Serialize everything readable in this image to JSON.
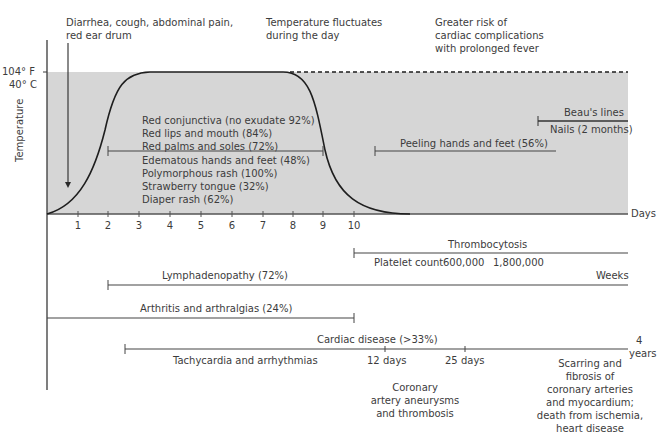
{
  "annotations_top": {
    "early_symptoms": [
      "Diarrhea, cough, abdominal pain,",
      "red ear drum"
    ],
    "temperature_note": [
      "Temperature fluctuates",
      "during the day"
    ],
    "risk_note": [
      "Greater risk of",
      "cardiac complications",
      "with prolonged fever"
    ]
  },
  "axis": {
    "y_label": "Temperature",
    "y_tick_f": "104° F",
    "y_tick_c": "40° C",
    "x_label_days": "Days",
    "x_ticks": [
      "1",
      "2",
      "3",
      "4",
      "5",
      "6",
      "7",
      "8",
      "9",
      "10"
    ]
  },
  "acute_symptoms": [
    "Red conjunctiva (no exudate 92%)",
    "Red lips and mouth (84%)",
    "Red palms and soles (72%)",
    "Edematous hands and feet (48%)",
    "Polymorphous rash (100%)",
    "Strawberry tongue (32%)",
    "Diaper rash (62%)"
  ],
  "subacute": {
    "peeling": "Peeling hands and feet (56%)",
    "beaus_lines": "Beau's lines",
    "nails": "Nails (2 months)"
  },
  "timelines": {
    "thrombocytosis": "Thrombocytosis",
    "platelet_label": "Platelet count",
    "platelet_low": "600,000",
    "platelet_high": "1,800,000",
    "weeks": "Weeks",
    "lymphadenopathy": "Lymphadenopathy (72%)",
    "arthritis": "Arthritis and arthralgias (24%)",
    "cardiac": "Cardiac disease (>33%)",
    "tachy": "Tachycardia and arrhythmias",
    "day12": "12 days",
    "day25": "25 days",
    "years_num": "4",
    "years_label": "years"
  },
  "cardiac_outcomes": {
    "aneurysm": [
      "Coronary",
      "artery aneurysms",
      "and thrombosis"
    ],
    "scarring": [
      "Scarring and",
      "fibrosis of",
      "coronary arteries",
      "and myocardium;",
      "death from ischemia,",
      "heart disease"
    ]
  },
  "colors": {
    "fever_region": "#d6d6d6",
    "line": "#3a3a3a"
  }
}
